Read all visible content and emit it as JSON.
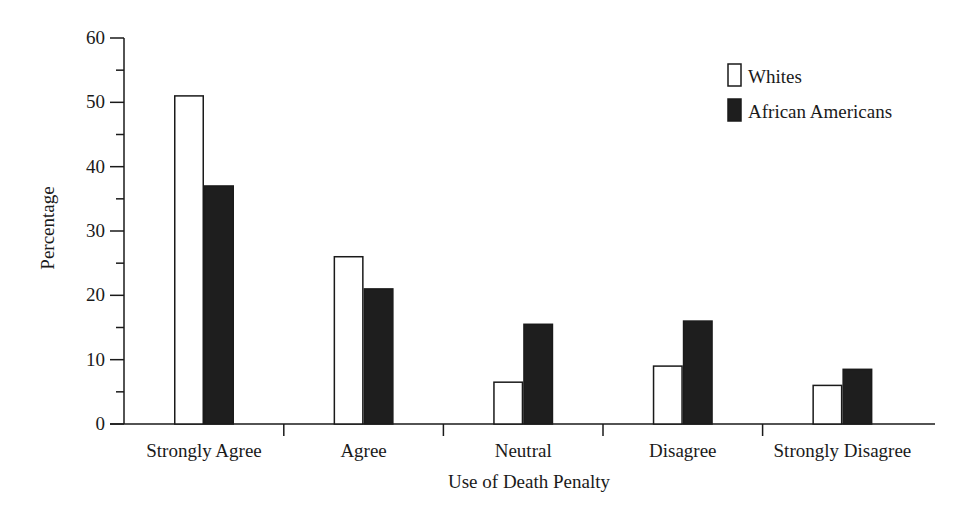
{
  "chart_data": {
    "type": "bar",
    "title": "",
    "xlabel": "Use of Death Penalty",
    "ylabel": "Percentage",
    "ylim": [
      0,
      60
    ],
    "yticks": [
      0,
      10,
      20,
      30,
      40,
      50,
      60
    ],
    "grid": false,
    "legend_position": "upper right",
    "categories": [
      "Strongly Agree",
      "Agree",
      "Neutral",
      "Disagree",
      "Strongly Disagree"
    ],
    "series": [
      {
        "name": "Whites",
        "color": "#ffffff",
        "values": [
          51,
          26,
          6.5,
          9,
          6
        ]
      },
      {
        "name": "African Americans",
        "color": "#1e1e1e",
        "values": [
          37,
          21,
          15.5,
          16,
          8.5
        ]
      }
    ]
  }
}
